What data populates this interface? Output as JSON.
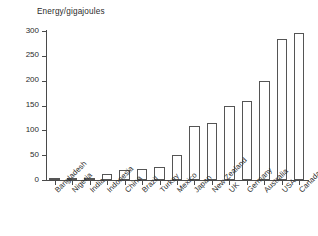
{
  "chart_data": {
    "type": "bar",
    "title": "",
    "ylabel": "Energy/gigajoules",
    "xlabel": "",
    "ylim": [
      0,
      300
    ],
    "yticks": [
      0,
      50,
      100,
      150,
      200,
      250,
      300
    ],
    "grid": false,
    "legend": null,
    "categories": [
      "Bangladesh",
      "Nigeria",
      "India",
      "Indonesia",
      "China",
      "Brazil",
      "Turkey",
      "Mexico",
      "Japan",
      "New Zealand",
      "UK",
      "Germany",
      "Australia",
      "USA",
      "Canada"
    ],
    "values": [
      3,
      3,
      4,
      13,
      21,
      22,
      27,
      50,
      108,
      115,
      149,
      159,
      199,
      283,
      295
    ]
  },
  "axis": {
    "y_label": "Energy/gigajoules"
  }
}
